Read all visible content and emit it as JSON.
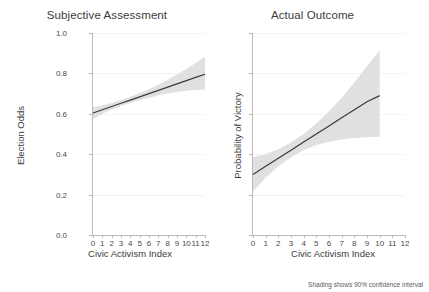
{
  "figure": {
    "footnote": "Shading shows 90% confidence interval",
    "band_color": "#e0e0e0",
    "line_color": "#3a3a3a",
    "axis_color": "#b9b9b9",
    "grid_color": "#f2f2f2"
  },
  "chart_data": [
    {
      "type": "line",
      "title": "Subjective Assessment",
      "xlabel": "Civic Activism Index",
      "ylabel": "Election Odds",
      "xlim": [
        0,
        12
      ],
      "ylim": [
        0,
        5
      ],
      "grid": true,
      "legend_position": "none",
      "xticks": [
        0,
        1,
        2,
        3,
        4,
        5,
        6,
        7,
        8,
        9,
        10,
        11,
        12
      ],
      "xtick_labels": [
        "0",
        "1",
        "2",
        "3",
        "4",
        "5",
        "6",
        "7",
        "8",
        "9",
        "10",
        "11",
        "12"
      ],
      "yticks": [
        0,
        1,
        2,
        3,
        4,
        5
      ],
      "ytick_labels": [
        "No Chance",
        "Little",
        "Some Chance",
        "Average",
        "Good Chance",
        "Certain"
      ],
      "series": [
        {
          "name": "Subjective Assessment fit",
          "x": [
            0,
            1,
            2,
            3,
            4,
            5,
            6,
            7,
            8,
            9,
            10,
            11,
            12
          ],
          "values": [
            3.02,
            3.1,
            3.18,
            3.26,
            3.34,
            3.42,
            3.5,
            3.58,
            3.66,
            3.74,
            3.82,
            3.9,
            3.98
          ],
          "ci_lower": [
            2.88,
            3.0,
            3.1,
            3.19,
            3.27,
            3.34,
            3.4,
            3.46,
            3.5,
            3.54,
            3.57,
            3.59,
            3.6
          ],
          "ci_upper": [
            3.16,
            3.21,
            3.27,
            3.34,
            3.42,
            3.51,
            3.61,
            3.72,
            3.84,
            3.97,
            4.11,
            4.26,
            4.42
          ]
        }
      ]
    },
    {
      "type": "line",
      "title": "Actual Outcome",
      "xlabel": "Civic Activism Index",
      "ylabel": "Probability of Victory",
      "xlim": [
        0,
        12
      ],
      "ylim": [
        0.0,
        1.0
      ],
      "grid": true,
      "legend_position": "none",
      "xticks": [
        0,
        1,
        2,
        3,
        4,
        5,
        6,
        7,
        8,
        9,
        10,
        11,
        12
      ],
      "xtick_labels": [
        "0",
        "1",
        "2",
        "3",
        "4",
        "5",
        "6",
        "7",
        "8",
        "9",
        "10",
        "11",
        "12"
      ],
      "yticks": [
        0.0,
        0.2,
        0.4,
        0.6,
        0.8,
        1.0
      ],
      "ytick_labels": [
        "0.0",
        "0.2",
        "0.4",
        "0.6",
        "0.8",
        "1.0"
      ],
      "series": [
        {
          "name": "Actual Outcome fit",
          "x": [
            0,
            1,
            2,
            3,
            4,
            5,
            6,
            7,
            8,
            9,
            10
          ],
          "values": [
            0.3,
            0.34,
            0.38,
            0.42,
            0.46,
            0.5,
            0.54,
            0.58,
            0.62,
            0.66,
            0.69
          ],
          "ci_lower": [
            0.215,
            0.285,
            0.34,
            0.385,
            0.42,
            0.445,
            0.462,
            0.473,
            0.48,
            0.484,
            0.486
          ],
          "ci_upper": [
            0.385,
            0.4,
            0.425,
            0.458,
            0.5,
            0.552,
            0.612,
            0.68,
            0.755,
            0.835,
            0.915
          ]
        }
      ]
    }
  ]
}
